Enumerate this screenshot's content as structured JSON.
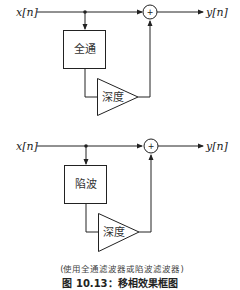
{
  "diagrams": [
    {
      "input_label": "x[n]",
      "output_label": "y[n]",
      "filter_label": "全通",
      "gain_label": "深度",
      "sum_symbol": "+"
    },
    {
      "input_label": "x[n]",
      "output_label": "y[n]",
      "filter_label": "陷波",
      "gain_label": "深度",
      "sum_symbol": "+"
    }
  ],
  "caption": "(使用全通滤波器或陷波滤波器)",
  "figure_title": "图 10.13：移相效果框图"
}
